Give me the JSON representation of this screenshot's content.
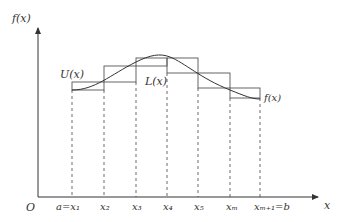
{
  "labels": {
    "y_axis": "f(x)",
    "x_axis": "x",
    "origin": "O",
    "upper": "U(x)",
    "lower": "L(x)",
    "curve": "f(x)",
    "ticks": [
      "a=x₁",
      "x₂",
      "x₃",
      "x₄",
      "x₅",
      "xₘ",
      "xₘ₊₁=b"
    ]
  },
  "geometry": {
    "tick_px": [
      72,
      104,
      136,
      167,
      198,
      230,
      260
    ],
    "upper_tops": [
      82,
      66,
      58,
      58,
      73,
      88
    ],
    "lower_tops": [
      90,
      82,
      66,
      73,
      88,
      98
    ]
  },
  "colors": {
    "line": "#333333",
    "rect": "#555555"
  }
}
